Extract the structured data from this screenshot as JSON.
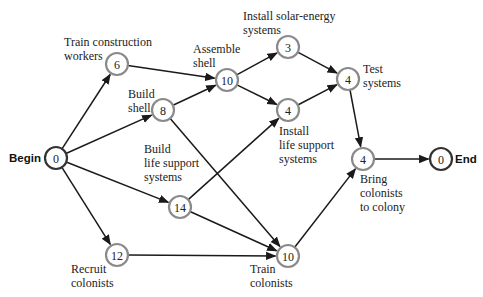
{
  "diagram": {
    "type": "activity-network",
    "nodes": [
      {
        "id": "begin",
        "duration": "0",
        "label": [
          "Begin"
        ],
        "x": 56,
        "y": 158,
        "terminal": true,
        "label_pos": "left"
      },
      {
        "id": "train-construction",
        "duration": "6",
        "label": [
          "Train construction",
          "workers"
        ],
        "x": 117,
        "y": 64
      },
      {
        "id": "build-shell",
        "duration": "8",
        "label": [
          "Build",
          "shell"
        ],
        "x": 163,
        "y": 110
      },
      {
        "id": "assemble-shell",
        "duration": "10",
        "label": [
          "Assemble",
          "shell"
        ],
        "x": 227,
        "y": 80
      },
      {
        "id": "install-solar",
        "duration": "3",
        "label": [
          "Install solar-energy",
          "systems"
        ],
        "x": 288,
        "y": 47
      },
      {
        "id": "test-systems",
        "duration": "4",
        "label": [
          "Test",
          "systems"
        ],
        "x": 348,
        "y": 79
      },
      {
        "id": "install-life-support",
        "duration": "4",
        "label": [
          "Install",
          "life support",
          "systems"
        ],
        "x": 288,
        "y": 110
      },
      {
        "id": "build-life-support",
        "duration": "14",
        "label": [
          "Build",
          "life support",
          "systems"
        ],
        "x": 180,
        "y": 207
      },
      {
        "id": "recruit-colonists",
        "duration": "12",
        "label": [
          "Recruit",
          "colonists"
        ],
        "x": 117,
        "y": 255
      },
      {
        "id": "train-colonists",
        "duration": "10",
        "label": [
          "Train",
          "colonists"
        ],
        "x": 288,
        "y": 256
      },
      {
        "id": "bring-colonists",
        "duration": "4",
        "label": [
          "Bring",
          "colonists",
          "to colony"
        ],
        "x": 363,
        "y": 159
      },
      {
        "id": "end",
        "duration": "0",
        "label": [
          "End"
        ],
        "x": 441,
        "y": 159,
        "terminal": true,
        "label_pos": "right"
      }
    ],
    "edges": [
      [
        "begin",
        "train-construction"
      ],
      [
        "begin",
        "build-shell"
      ],
      [
        "begin",
        "build-life-support"
      ],
      [
        "begin",
        "recruit-colonists"
      ],
      [
        "train-construction",
        "assemble-shell"
      ],
      [
        "build-shell",
        "assemble-shell"
      ],
      [
        "build-shell",
        "train-colonists"
      ],
      [
        "assemble-shell",
        "install-solar"
      ],
      [
        "assemble-shell",
        "install-life-support"
      ],
      [
        "install-solar",
        "test-systems"
      ],
      [
        "install-life-support",
        "test-systems"
      ],
      [
        "build-life-support",
        "install-life-support"
      ],
      [
        "build-life-support",
        "train-colonists"
      ],
      [
        "recruit-colonists",
        "train-colonists"
      ],
      [
        "test-systems",
        "bring-colonists"
      ],
      [
        "train-colonists",
        "bring-colonists"
      ],
      [
        "bring-colonists",
        "end"
      ]
    ],
    "text": {
      "begin": "Begin",
      "end": "End",
      "train_construction": [
        "Train construction",
        "workers"
      ],
      "build_shell": [
        "Build",
        "shell"
      ],
      "assemble_shell": [
        "Assemble",
        "shell"
      ],
      "install_solar": [
        "Install solar-energy",
        "systems"
      ],
      "test_systems": [
        "Test",
        "systems"
      ],
      "install_life_support": [
        "Install",
        "life support",
        "systems"
      ],
      "build_life_support": [
        "Build",
        "life support",
        "systems"
      ],
      "recruit_colonists": [
        "Recruit",
        "colonists"
      ],
      "train_colonists": [
        "Train",
        "colonists"
      ],
      "bring_colonists": [
        "Bring",
        "colonists",
        "to colony"
      ]
    },
    "colors": {
      "edge": "#1a1a1a",
      "node_stroke": "#8a8a8a",
      "terminal_stroke": "#333333",
      "text": "#222222"
    }
  }
}
